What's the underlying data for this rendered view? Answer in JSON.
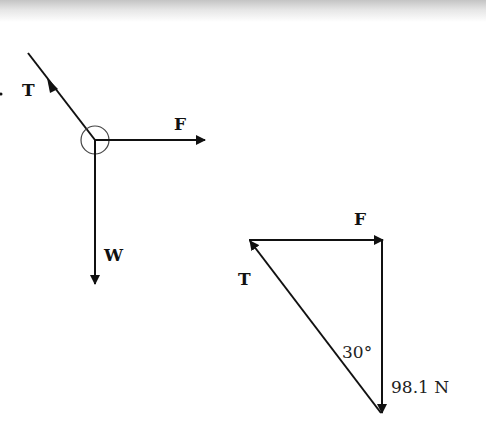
{
  "diagram": {
    "free_body": {
      "labels": {
        "tension": "T",
        "force": "F",
        "weight": "W"
      }
    },
    "triangle": {
      "labels": {
        "force": "F",
        "tension": "T",
        "angle": "30°",
        "weight_value": "98.1 N"
      }
    }
  }
}
